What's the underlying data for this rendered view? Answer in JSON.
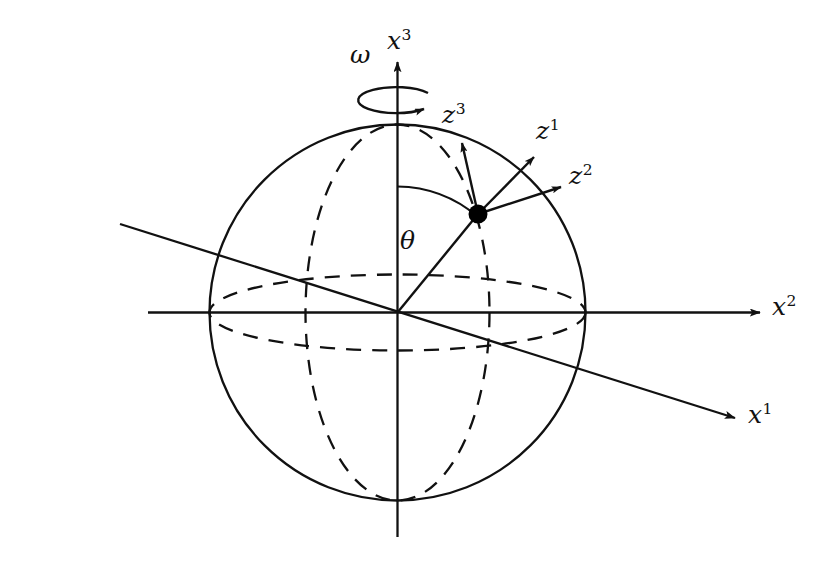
{
  "figure": {
    "kind": "geometry-diagram",
    "background_color": "#ffffff",
    "stroke_color": "#111111"
  },
  "labels": {
    "omega": {
      "text": "ω",
      "x": 350,
      "y": 42,
      "italic": true
    },
    "x3": {
      "base": "x",
      "sup": "3",
      "x": 387,
      "y": 28
    },
    "x2": {
      "base": "x",
      "sup": "2",
      "x": 772,
      "y": 294
    },
    "x1": {
      "base": "x",
      "sup": "1",
      "x": 748,
      "y": 402
    },
    "z3": {
      "base": "z",
      "sup": "3",
      "x": 442,
      "y": 102
    },
    "z1": {
      "base": "z",
      "sup": "1",
      "x": 536,
      "y": 118
    },
    "z2": {
      "base": "z",
      "sup": "2",
      "x": 569,
      "y": 163
    },
    "theta": {
      "text": "θ",
      "x": 400,
      "y": 228,
      "italic": true
    }
  },
  "geometry": {
    "sphere": {
      "cx": 397.5,
      "cy": 312.5,
      "r": 188
    },
    "origin": {
      "x": 397.5,
      "y": 312.5
    },
    "particle": {
      "x": 478,
      "y": 214,
      "radius": 9.5,
      "fill": "#000000"
    },
    "equator_ellipse": {
      "cx": 397.5,
      "cy": 312.5,
      "rx": 188,
      "ry": 38,
      "dashed": true
    },
    "meridian_ellipse": {
      "cx": 397.5,
      "cy": 312.5,
      "rx": 92,
      "ry": 188,
      "dashed": true
    },
    "axis_x3": {
      "x1": 397.5,
      "y1": 535,
      "x2": 397.5,
      "y2": 62,
      "arrow": "up"
    },
    "axis_x2": {
      "x1": 148,
      "y1": 312.5,
      "x2": 760,
      "y2": 312.5,
      "arrow": "right"
    },
    "axis_x1": {
      "x1": 120,
      "y1": 224,
      "x2": 735,
      "y2": 418,
      "arrow": "right"
    },
    "radius_line": {
      "x1": 397.5,
      "y1": 312.5,
      "x2": 478,
      "y2": 214
    },
    "theta_arc": {
      "cx": 397.5,
      "cy": 312.5,
      "radius": 126,
      "from_deg": 90,
      "to_deg": 50.6
    },
    "rotation_arrow": {
      "cx": 397.5,
      "cy": 100,
      "rx": 38,
      "ry": 13
    },
    "triad": [
      {
        "name": "z3",
        "x1": 478,
        "y1": 214,
        "x2": 462,
        "y2": 140
      },
      {
        "name": "z1",
        "x1": 478,
        "y1": 214,
        "x2": 537,
        "y2": 154
      },
      {
        "name": "z2",
        "x1": 478,
        "y1": 214,
        "x2": 564,
        "y2": 185
      }
    ]
  }
}
